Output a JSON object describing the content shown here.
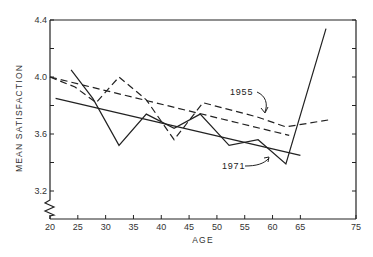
{
  "chart_data": {
    "type": "line",
    "title": "",
    "xlabel": "AGE",
    "ylabel": "MEAN   SATISFACTION",
    "xlim": [
      20,
      75
    ],
    "ylim": [
      3.2,
      4.4
    ],
    "y_axis_break": true,
    "grid": false,
    "legend": "annotations",
    "x_ticks": [
      20,
      25,
      30,
      35,
      40,
      45,
      50,
      55,
      60,
      65,
      75
    ],
    "x_tick_labels": [
      "20",
      "25",
      "30",
      "35",
      "40",
      "45",
      "50",
      "55",
      "60",
      "65",
      "75"
    ],
    "y_ticks": [
      3.2,
      3.4,
      3.6,
      3.8,
      4.0,
      4.2,
      4.4
    ],
    "y_tick_labels": [
      "3.2",
      "",
      "3.6",
      "",
      "4.0",
      "",
      "4.4"
    ],
    "series": [
      {
        "name": "1955",
        "style": "dashed",
        "x": [
          20,
          24.5,
          28.3,
          32.4,
          37.3,
          42.3,
          47.5,
          57.2,
          62.4,
          70.2
        ],
        "values": [
          4.0,
          3.93,
          3.82,
          4.0,
          3.84,
          3.56,
          3.82,
          3.72,
          3.65,
          3.7
        ]
      },
      {
        "name": "1955 trend",
        "style": "dashed",
        "x": [
          20,
          63
        ],
        "values": [
          4.0,
          3.59
        ]
      },
      {
        "name": "1971",
        "style": "solid",
        "x": [
          23.8,
          27.7,
          32.4,
          37.3,
          42.3,
          47,
          52.2,
          57.4,
          62.4,
          69.6
        ],
        "values": [
          4.05,
          3.85,
          3.52,
          3.74,
          3.64,
          3.74,
          3.52,
          3.56,
          3.39,
          4.34
        ]
      },
      {
        "name": "1971 trend",
        "style": "solid",
        "x": [
          21,
          65
        ],
        "values": [
          3.85,
          3.45
        ]
      }
    ],
    "annotations": [
      {
        "text": "1955",
        "points_to": "1955 trend"
      },
      {
        "text": "1971",
        "points_to": "1971 trend"
      }
    ]
  },
  "labels": {
    "ann_1955": "1955",
    "ann_1971": "1971",
    "xlabel": "AGE",
    "ylabel": "MEAN   SATISFACTION"
  }
}
